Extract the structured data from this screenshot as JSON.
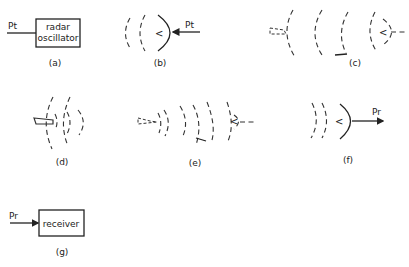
{
  "panels": {
    "a": {
      "caption": "(a)",
      "signal_label": "Pt",
      "box_line1": "radar",
      "box_line2": "oscillator"
    },
    "b": {
      "caption": "(b)",
      "signal_label": "Pt",
      "antenna_symbol": "<"
    },
    "c": {
      "caption": "(c)",
      "antenna_symbol": "<"
    },
    "d": {
      "caption": "(d)"
    },
    "e": {
      "caption": "(e)",
      "antenna_symbol": "<"
    },
    "f": {
      "caption": "(f)",
      "signal_label": "Pr",
      "antenna_symbol": "<"
    },
    "g": {
      "caption": "(g)",
      "signal_label": "Pr",
      "box_label": "receiver"
    }
  }
}
